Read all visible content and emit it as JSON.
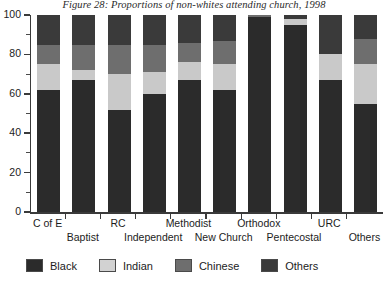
{
  "chart_data": {
    "type": "bar",
    "subtype": "stacked-percentage",
    "title": "Figure 28: Proportions of non-whites attending church, 1998",
    "xlabel": "",
    "ylabel": "",
    "ylim": [
      0,
      100
    ],
    "ytick_labels": [
      "0",
      "20",
      "40",
      "60",
      "80",
      "100"
    ],
    "ytick_values": [
      0,
      20,
      40,
      60,
      80,
      100
    ],
    "yminor_values": [
      10,
      30,
      50,
      70,
      90
    ],
    "grid": false,
    "legend_position": "bottom",
    "categories": [
      "C of E",
      "Baptist",
      "RC",
      "Independent",
      "Methodist",
      "New Church",
      "Orthodox",
      "Pentecostal",
      "URC",
      "Others"
    ],
    "series": [
      {
        "name": "Black",
        "color": "#2b2b2b",
        "values": [
          62,
          67,
          52,
          60,
          67,
          62,
          99,
          95,
          67,
          55
        ]
      },
      {
        "name": "Indian",
        "color": "#c9c9c9",
        "values": [
          13,
          5,
          18,
          11,
          9,
          13,
          0,
          3,
          13,
          20
        ]
      },
      {
        "name": "Chinese",
        "color": "#6e6e6e",
        "values": [
          10,
          13,
          15,
          14,
          10,
          12,
          1,
          0,
          0,
          13
        ]
      },
      {
        "name": "Others",
        "color": "#3a3a3a",
        "values": [
          15,
          15,
          15,
          15,
          14,
          13,
          0,
          2,
          20,
          12
        ]
      }
    ]
  },
  "legend": {
    "items": [
      {
        "label": "Black",
        "color": "#2b2b2b"
      },
      {
        "label": "Indian",
        "color": "#d2d2d2"
      },
      {
        "label": "Chinese",
        "color": "#6e6e6e"
      },
      {
        "label": "Others",
        "color": "#3a3a3a"
      }
    ]
  }
}
